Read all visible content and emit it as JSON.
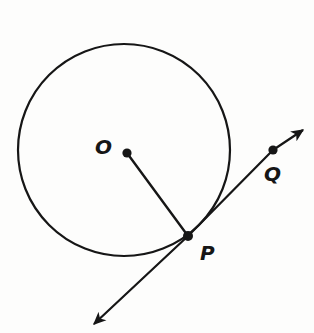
{
  "figure": {
    "kind": "circle-tangent-diagram",
    "labels": {
      "center": "O",
      "tangency_point": "P",
      "external_point": "Q"
    },
    "colors": {
      "ink": "#161616",
      "background": "#fdfdfc"
    }
  }
}
